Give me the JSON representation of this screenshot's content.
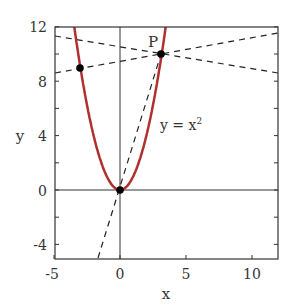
{
  "chart_data": {
    "type": "line",
    "title": "",
    "xlabel": "x",
    "ylabel": "y",
    "xlim": [
      -5,
      12
    ],
    "ylim": [
      -5,
      12
    ],
    "xticks": [
      "-5",
      "0",
      "5",
      "10"
    ],
    "yticks": [
      "-4",
      "0",
      "4",
      "8",
      "12"
    ],
    "curve_label": "y = x²",
    "point_label": "P",
    "series": [
      {
        "name": "y = x^2",
        "color": "#b03030",
        "function": "x^2"
      },
      {
        "name": "secant through origin and P",
        "style": "dashed",
        "points": [
          [
            -1.7,
            -5
          ],
          [
            3.2,
            10.1
          ]
        ]
      },
      {
        "name": "line through (-3,9) and P",
        "style": "dashed",
        "points": [
          [
            -5,
            8.6
          ],
          [
            12,
            11.4
          ]
        ]
      },
      {
        "name": "line through P descending",
        "style": "dashed",
        "points": [
          [
            -5,
            11.3
          ],
          [
            12,
            8.5
          ]
        ]
      }
    ],
    "markers": [
      [
        -3,
        9
      ],
      [
        0,
        0
      ],
      [
        3.2,
        10.1
      ]
    ],
    "grid": false
  }
}
